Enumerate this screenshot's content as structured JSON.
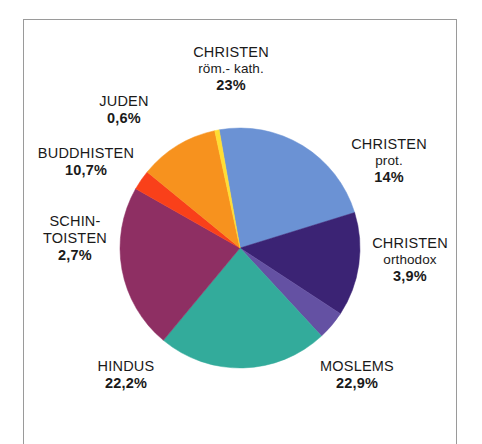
{
  "figure": {
    "background_color": "#ffffff",
    "frame_color": "#9a9a9a"
  },
  "chart_data": {
    "type": "pie",
    "title": "",
    "subtitle": "",
    "xlabel": "",
    "ylabel": "",
    "legend_position": "none",
    "grid": false,
    "start_angle_deg": -10,
    "direction": "clockwise",
    "center": [
      240,
      248
    ],
    "radius": 120,
    "categories": [
      "CHRISTEN röm.- kath.",
      "CHRISTEN prot.",
      "CHRISTEN orthodox",
      "MOSLEMS",
      "HINDUS",
      "SCHINTOISTEN",
      "BUDDHISTEN",
      "JUDEN"
    ],
    "values": [
      23,
      14,
      3.9,
      22.9,
      22.2,
      2.7,
      10.7,
      0.6
    ],
    "value_labels": [
      "23%",
      "14%",
      "3,9%",
      "22,9%",
      "22,2%",
      "2,7%",
      "10,7%",
      "0,6%"
    ],
    "colors": [
      "#6b92d4",
      "#3b2374",
      "#6451a3",
      "#33ab9b",
      "#8e2f63",
      "#f9401a",
      "#f7921e",
      "#ffdd33"
    ],
    "slices": [
      {
        "id": "roemkath",
        "name": "CHRISTEN",
        "sub": "röm.- kath.",
        "pct": "23%",
        "value": 23,
        "color": "#6b92d4"
      },
      {
        "id": "prot",
        "name": "CHRISTEN",
        "sub": "prot.",
        "pct": "14%",
        "value": 14,
        "color": "#3b2374"
      },
      {
        "id": "orthodox",
        "name": "CHRISTEN",
        "sub": "orthodox",
        "pct": "3,9%",
        "value": 3.9,
        "color": "#6451a3"
      },
      {
        "id": "moslems",
        "name": "MOSLEMS",
        "sub": "",
        "pct": "22,9%",
        "value": 22.9,
        "color": "#33ab9b"
      },
      {
        "id": "hindus",
        "name": "HINDUS",
        "sub": "",
        "pct": "22,2%",
        "value": 22.2,
        "color": "#8e2f63"
      },
      {
        "id": "schintoisten",
        "name_line1": "SCHIN-",
        "name_line2": "TOISTEN",
        "pct": "2,7%",
        "value": 2.7,
        "color": "#f9401a"
      },
      {
        "id": "buddhisten",
        "name": "BUDDHISTEN",
        "sub": "",
        "pct": "10,7%",
        "value": 10.7,
        "color": "#f7921e"
      },
      {
        "id": "juden",
        "name": "JUDEN",
        "sub": "",
        "pct": "0,6%",
        "value": 0.6,
        "color": "#ffdd33"
      }
    ]
  }
}
